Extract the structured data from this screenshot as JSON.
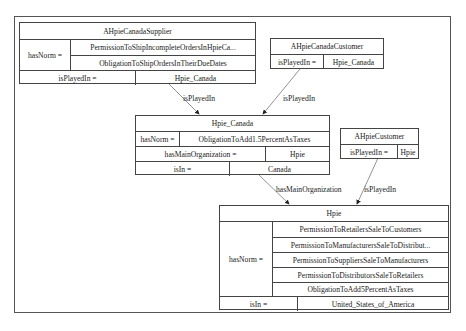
{
  "diagram": {
    "nodes": {
      "supplier": {
        "title": "AHpieCanadaSupplier",
        "hasNorm_key": "hasNorm =",
        "norms": [
          "PermissionToShipIncompleteOrdersInHpieCa...",
          "ObligationToShipOrdersInTheirDueDates"
        ],
        "isPlayedIn_key": "isPlayedIn =",
        "isPlayedIn_val": "Hpie_Canada"
      },
      "canada_customer": {
        "title": "AHpieCanadaCustomer",
        "isPlayedIn_key": "isPlayedIn =",
        "isPlayedIn_val": "Hpie_Canada"
      },
      "hpie_canada": {
        "title": "Hpie_Canada",
        "hasNorm_key": "hasNorm =",
        "hasNorm_val": "ObligationToAdd1.5PercentAsTaxes",
        "hasMainOrganization_key": "hasMainOrganization =",
        "hasMainOrganization_val": "Hpie",
        "isIn_key": "isIn =",
        "isIn_val": "Canada"
      },
      "customer": {
        "title": "AHpieCustomer",
        "isPlayedIn_key": "isPlayedIn =",
        "isPlayedIn_val": "Hpie"
      },
      "hpie": {
        "title": "Hpie",
        "hasNorm_key": "hasNorm =",
        "norms": [
          "PermissionToRetailersSaleToCustomers",
          "PermissionToManufacturersSaleToDistribut...",
          "PermissionToSuppliersSaleToManufacturers",
          "PermissionToDistributorsSaleToRetailers",
          "ObligationToAdd5PercentAsTaxes"
        ],
        "isIn_key": "isIn =",
        "isIn_val": "United_States_of_America"
      }
    },
    "edges": [
      {
        "from": "AHpieCanadaSupplier",
        "to": "Hpie_Canada",
        "label": "isPlayedIn"
      },
      {
        "from": "AHpieCanadaCustomer",
        "to": "Hpie_Canada",
        "label": "isPlayedIn"
      },
      {
        "from": "Hpie_Canada",
        "to": "Hpie",
        "label": "hasMainOrganization"
      },
      {
        "from": "AHpieCustomer",
        "to": "Hpie",
        "label": "isPlayedIn"
      }
    ],
    "colors": {
      "line": "#444444",
      "background": "#ffffff",
      "text": "#222222"
    }
  }
}
